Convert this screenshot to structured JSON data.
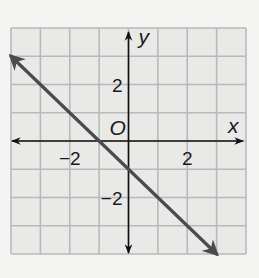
{
  "chart_data": {
    "type": "line",
    "title": "",
    "xlabel": "x",
    "ylabel": "y",
    "origin_label": "O",
    "xlim": [
      -4,
      4
    ],
    "ylim": [
      -4,
      4
    ],
    "grid": true,
    "grid_step": 1,
    "x_ticks": [
      {
        "value": -2,
        "label": "−2"
      },
      {
        "value": 2,
        "label": "2"
      }
    ],
    "y_ticks": [
      {
        "value": 2,
        "label": "2"
      },
      {
        "value": -2,
        "label": "−2"
      }
    ],
    "series": [
      {
        "name": "y = -x - 1",
        "slope": -1,
        "intercept": -1,
        "points": [
          {
            "x": -4,
            "y": 3
          },
          {
            "x": 3,
            "y": -4
          }
        ],
        "arrows": "both",
        "color": "#4a4a4f"
      }
    ]
  }
}
